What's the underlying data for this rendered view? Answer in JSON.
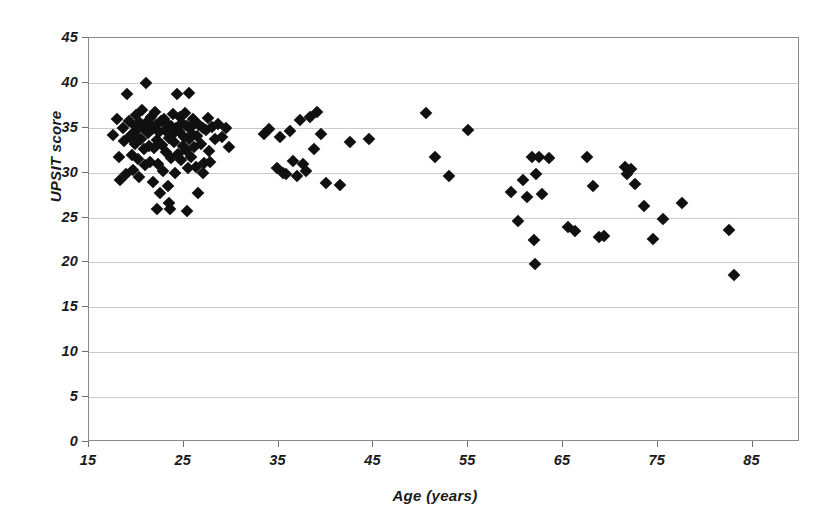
{
  "chart_data": {
    "type": "scatter",
    "title": "",
    "xlabel": "Age (years)",
    "ylabel": "UPSIT score",
    "xlim": [
      15,
      90
    ],
    "ylim": [
      0,
      45
    ],
    "xticks": [
      15,
      25,
      35,
      45,
      55,
      65,
      75,
      85
    ],
    "yticks": [
      0,
      5,
      10,
      15,
      20,
      25,
      30,
      35,
      40,
      45
    ],
    "xtick_labels": [
      "15",
      "25",
      "35",
      "45",
      "55",
      "65",
      "75",
      "85"
    ],
    "ytick_labels": [
      "0",
      "5",
      "10",
      "15",
      "20",
      "25",
      "30",
      "35",
      "40",
      "45"
    ],
    "grid": "horizontal",
    "legend": "none",
    "marker": "diamond",
    "marker_color": "#101010",
    "marker_size": 9,
    "grid_color": "#c9c9c9",
    "frame_color": "#8a8a8a",
    "background_color": "#ffffff",
    "series": [
      {
        "name": "Subjects",
        "points": [
          [
            17.5,
            34.2
          ],
          [
            18.0,
            36.0
          ],
          [
            18.2,
            31.8
          ],
          [
            18.3,
            29.2
          ],
          [
            18.6,
            35.0
          ],
          [
            18.7,
            33.5
          ],
          [
            18.9,
            29.8
          ],
          [
            19.0,
            38.8
          ],
          [
            19.2,
            35.8
          ],
          [
            19.3,
            34.0
          ],
          [
            19.5,
            32.0
          ],
          [
            19.6,
            30.3
          ],
          [
            19.8,
            35.2
          ],
          [
            19.9,
            33.2
          ],
          [
            20.0,
            36.4
          ],
          [
            20.1,
            34.7
          ],
          [
            20.2,
            31.5
          ],
          [
            20.3,
            29.5
          ],
          [
            20.4,
            35.5
          ],
          [
            20.5,
            33.8
          ],
          [
            20.6,
            37.0
          ],
          [
            20.7,
            35.0
          ],
          [
            20.8,
            32.6
          ],
          [
            20.9,
            30.8
          ],
          [
            21.0,
            40.0
          ],
          [
            21.1,
            35.6
          ],
          [
            21.2,
            34.4
          ],
          [
            21.3,
            33.0
          ],
          [
            21.4,
            31.2
          ],
          [
            21.5,
            36.2
          ],
          [
            21.6,
            34.9
          ],
          [
            21.7,
            29.0
          ],
          [
            21.8,
            35.1
          ],
          [
            21.9,
            32.8
          ],
          [
            22.0,
            36.8
          ],
          [
            22.1,
            35.3
          ],
          [
            22.2,
            33.6
          ],
          [
            22.3,
            31.0
          ],
          [
            22.4,
            34.5
          ],
          [
            22.5,
            27.7
          ],
          [
            22.6,
            35.8
          ],
          [
            22.7,
            33.1
          ],
          [
            22.8,
            30.2
          ],
          [
            22.9,
            36.0
          ],
          [
            23.0,
            34.8
          ],
          [
            23.1,
            32.3
          ],
          [
            23.2,
            35.4
          ],
          [
            23.3,
            28.5
          ],
          [
            23.4,
            33.9
          ],
          [
            23.5,
            26.0
          ],
          [
            23.6,
            35.2
          ],
          [
            23.7,
            31.6
          ],
          [
            23.8,
            34.2
          ],
          [
            23.9,
            36.5
          ],
          [
            24.0,
            33.4
          ],
          [
            24.1,
            30.0
          ],
          [
            24.2,
            35.0
          ],
          [
            24.3,
            38.8
          ],
          [
            24.4,
            32.1
          ],
          [
            24.5,
            34.6
          ],
          [
            24.6,
            36.2
          ],
          [
            24.7,
            31.4
          ],
          [
            24.8,
            35.5
          ],
          [
            24.9,
            33.0
          ],
          [
            25.0,
            34.0
          ],
          [
            25.1,
            36.6
          ],
          [
            25.2,
            32.5
          ],
          [
            25.3,
            35.2
          ],
          [
            25.4,
            30.5
          ],
          [
            25.5,
            33.7
          ],
          [
            25.6,
            38.9
          ],
          [
            25.7,
            35.0
          ],
          [
            25.8,
            31.8
          ],
          [
            25.9,
            34.3
          ],
          [
            26.0,
            36.0
          ],
          [
            26.1,
            32.9
          ],
          [
            26.2,
            35.6
          ],
          [
            26.3,
            30.6
          ],
          [
            26.4,
            34.1
          ],
          [
            26.5,
            27.7
          ],
          [
            26.6,
            35.3
          ],
          [
            26.8,
            33.2
          ],
          [
            27.0,
            35.0
          ],
          [
            27.1,
            31.1
          ],
          [
            27.3,
            34.7
          ],
          [
            27.5,
            36.1
          ],
          [
            27.7,
            32.4
          ],
          [
            28.0,
            35.1
          ],
          [
            28.3,
            33.8
          ],
          [
            28.6,
            35.4
          ],
          [
            29.0,
            34.0
          ],
          [
            29.4,
            35.0
          ],
          [
            29.8,
            32.9
          ],
          [
            25.3,
            25.7
          ],
          [
            22.2,
            25.9
          ],
          [
            23.4,
            26.6
          ],
          [
            20.0,
            34.0
          ],
          [
            19.4,
            34.2
          ],
          [
            27.0,
            30.0
          ],
          [
            27.8,
            31.2
          ],
          [
            33.5,
            34.3
          ],
          [
            34.0,
            34.9
          ],
          [
            34.8,
            30.5
          ],
          [
            35.2,
            34.0
          ],
          [
            35.5,
            30.0
          ],
          [
            35.8,
            29.9
          ],
          [
            36.2,
            34.6
          ],
          [
            36.5,
            31.3
          ],
          [
            36.9,
            29.6
          ],
          [
            37.3,
            35.9
          ],
          [
            37.6,
            31.0
          ],
          [
            37.9,
            30.2
          ],
          [
            38.3,
            36.2
          ],
          [
            38.7,
            32.6
          ],
          [
            39.1,
            36.8
          ],
          [
            39.5,
            34.3
          ],
          [
            40.0,
            28.8
          ],
          [
            41.5,
            28.6
          ],
          [
            42.5,
            33.4
          ],
          [
            44.5,
            33.8
          ],
          [
            50.5,
            36.7
          ],
          [
            51.5,
            31.7
          ],
          [
            53.0,
            29.6
          ],
          [
            55.0,
            34.7
          ],
          [
            59.5,
            27.8
          ],
          [
            60.3,
            24.6
          ],
          [
            60.8,
            29.2
          ],
          [
            61.2,
            27.3
          ],
          [
            61.7,
            31.8
          ],
          [
            61.9,
            22.5
          ],
          [
            62.2,
            29.8
          ],
          [
            62.5,
            31.8
          ],
          [
            62.8,
            27.6
          ],
          [
            63.5,
            31.6
          ],
          [
            62.0,
            19.8
          ],
          [
            65.5,
            24.0
          ],
          [
            66.3,
            23.5
          ],
          [
            67.5,
            31.7
          ],
          [
            68.2,
            28.5
          ],
          [
            68.8,
            22.8
          ],
          [
            69.3,
            23.0
          ],
          [
            71.5,
            30.6
          ],
          [
            71.8,
            29.9
          ],
          [
            72.2,
            30.4
          ],
          [
            72.6,
            28.7
          ],
          [
            73.5,
            26.3
          ],
          [
            74.5,
            22.6
          ],
          [
            75.5,
            24.8
          ],
          [
            77.5,
            26.6
          ],
          [
            82.5,
            23.6
          ],
          [
            83.0,
            18.6
          ]
        ]
      }
    ]
  },
  "axes": {
    "y_title": "UPSIT score",
    "x_title": "Age (years)"
  }
}
